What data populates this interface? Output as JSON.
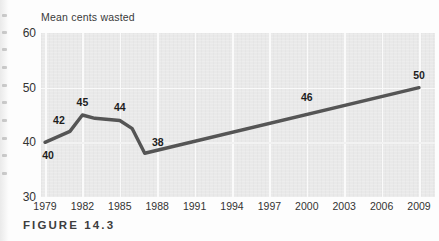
{
  "figure": {
    "caption": "FIGURE 14.3"
  },
  "chart_data": {
    "type": "line",
    "title": "",
    "ylabel": "Mean cents wasted",
    "xlabel": "",
    "ylim": [
      30,
      60
    ],
    "yticks": [
      30,
      40,
      50,
      60
    ],
    "ytick_labels": [
      "30",
      "40",
      "50",
      "60"
    ],
    "xlim": [
      1979,
      2009
    ],
    "xticks": [
      1979,
      1982,
      1985,
      1988,
      1991,
      1994,
      1997,
      2000,
      2003,
      2006,
      2009
    ],
    "xtick_labels": [
      "1979",
      "1982",
      "1985",
      "1988",
      "1991",
      "1994",
      "1997",
      "2000",
      "2003",
      "2006",
      "2009"
    ],
    "grid": "white gridlines on gray panel, vertical at each x tick, horizontal at y=50",
    "legend": "none",
    "line_color": "#555555",
    "panel_color": "#e9e9e9",
    "x": [
      1979,
      1981,
      1982,
      1983,
      1985,
      1986,
      1987,
      2009
    ],
    "y": [
      40,
      42,
      45,
      44.4,
      44,
      42.5,
      38,
      50
    ],
    "point_labels": [
      {
        "text": "40",
        "x": 1979,
        "y": 40,
        "pos": "below-right"
      },
      {
        "text": "42",
        "x": 1981,
        "y": 42,
        "pos": "above-left"
      },
      {
        "text": "45",
        "x": 1982,
        "y": 45,
        "pos": "above"
      },
      {
        "text": "44",
        "x": 1985,
        "y": 44,
        "pos": "above"
      },
      {
        "text": "38",
        "x": 1987,
        "y": 38,
        "pos": "above-right"
      },
      {
        "text": "46",
        "x": 2000,
        "y": 46,
        "pos": "above"
      },
      {
        "text": "50",
        "x": 2009,
        "y": 50,
        "pos": "above"
      }
    ],
    "annotations": [
      "Values rise from 40 cents in 1979 to a peak of 45 in 1982",
      "Decline to a low of 38 by 1987",
      "Steady linear rise from 38 to 50 cents through 2009"
    ]
  }
}
